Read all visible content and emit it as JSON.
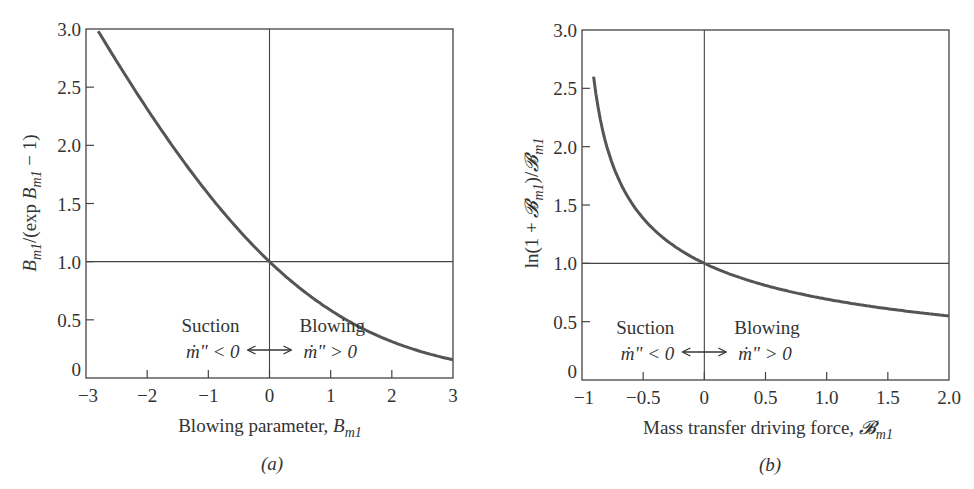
{
  "chart_data": [
    {
      "type": "line",
      "panel": "(a)",
      "title": "",
      "xlabel": "Blowing parameter, B_m1",
      "xlabel_main": "Blowing parameter, ",
      "xlabel_sym": "B",
      "xlabel_sub": "m1",
      "ylabel": "B_m1/(exp B_m1 − 1)",
      "xlim": [
        -3,
        3
      ],
      "ylim": [
        0,
        3.0
      ],
      "xticks": [
        -3,
        -2,
        -1,
        0,
        1,
        2,
        3
      ],
      "xtick_labels": [
        "−3",
        "−2",
        "−1",
        "0",
        "1",
        "2",
        "3"
      ],
      "yticks": [
        0,
        0.5,
        1.0,
        1.5,
        2.0,
        2.5,
        3.0
      ],
      "ytick_labels": [
        "0",
        "0.5",
        "1.0",
        "1.5",
        "2.0",
        "2.5",
        "3.0"
      ],
      "reference_lines": {
        "x": 0,
        "y": 1.0
      },
      "grid": false,
      "function": "B/(exp(B)-1)",
      "series": [
        {
          "name": "B_m1/(exp B_m1 − 1)",
          "x": [
            -2.8,
            -2.5,
            -2.0,
            -1.5,
            -1.0,
            -0.5,
            0,
            0.5,
            1.0,
            1.5,
            2.0,
            2.5,
            3.0
          ],
          "y": [
            2.98,
            2.72,
            2.31,
            1.93,
            1.58,
            1.27,
            1.0,
            0.77,
            0.58,
            0.43,
            0.31,
            0.23,
            0.16
          ]
        }
      ],
      "annotations": {
        "left_word": "Suction",
        "left_cond": "ṁ\" < 0",
        "right_word": "Blowing",
        "right_cond": "ṁ\" > 0",
        "arrow": "double-headed"
      }
    },
    {
      "type": "line",
      "panel": "(b)",
      "title": "",
      "xlabel": "Mass transfer driving force, 𝓑_m1",
      "xlabel_main": "Mass transfer driving force, ",
      "xlabel_sym": "𝓑",
      "xlabel_sub": "m1",
      "ylabel": "ln(1 + 𝓑_m1)/𝓑_m1",
      "xlim": [
        -1,
        2.0
      ],
      "ylim": [
        0,
        3.0
      ],
      "xticks": [
        -1,
        -0.5,
        0,
        0.5,
        1.0,
        1.5,
        2.0
      ],
      "xtick_labels": [
        "−1",
        "−0.5",
        "0",
        "0.5",
        "1.0",
        "1.5",
        "2.0"
      ],
      "yticks": [
        0,
        0.5,
        1.0,
        1.5,
        2.0,
        2.5,
        3.0
      ],
      "ytick_labels": [
        "0",
        "0.5",
        "1.0",
        "1.5",
        "2.0",
        "2.5",
        "3.0"
      ],
      "reference_lines": {
        "x": 0,
        "y": 1.0
      },
      "grid": false,
      "function": "ln(1+B)/B",
      "series": [
        {
          "name": "ln(1 + 𝓑_m1)/𝓑_m1",
          "x": [
            -0.905,
            -0.8,
            -0.6,
            -0.4,
            -0.2,
            0,
            0.25,
            0.5,
            0.75,
            1.0,
            1.25,
            1.5,
            1.75,
            2.0
          ],
          "y": [
            2.62,
            2.01,
            1.53,
            1.28,
            1.12,
            1.0,
            0.89,
            0.81,
            0.75,
            0.69,
            0.65,
            0.61,
            0.58,
            0.55
          ]
        }
      ],
      "annotations": {
        "left_word": "Suction",
        "left_cond": "ṁ\" < 0",
        "right_word": "Blowing",
        "right_cond": "ṁ\" > 0",
        "arrow": "double-headed"
      }
    }
  ],
  "panels": {
    "a": {
      "label": "(a)",
      "ylabel_parts": [
        "B",
        "m1",
        "/(exp ",
        "B",
        "m1",
        " − 1)"
      ]
    },
    "b": {
      "label": "(b)",
      "ylabel_parts": [
        "ln(1 + ",
        "𝓑",
        "m1",
        ")/",
        "𝓑",
        "m1"
      ]
    }
  },
  "colors": {
    "curve": "#555555",
    "frame": "#444444",
    "text": "#333333",
    "background": "#ffffff"
  }
}
